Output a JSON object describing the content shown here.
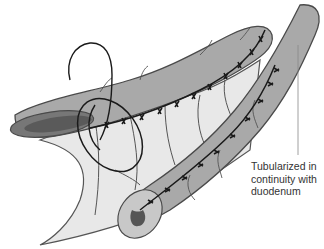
{
  "figure": {
    "colors": {
      "bowel_fill": "#a9a9a9",
      "bowel_outline": "#4a4a4a",
      "mesentery_fill": "#e6e6e6",
      "lumen": "#555555",
      "suture": "#1a1a1a",
      "background": "#ffffff"
    }
  },
  "annotation": {
    "lines": [
      "Tubularized in",
      "continuity with",
      "duodenum"
    ]
  }
}
